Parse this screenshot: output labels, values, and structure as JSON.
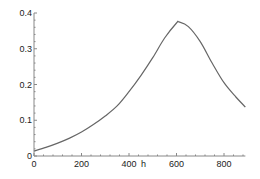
{
  "chart_data": {
    "type": "line",
    "title": "",
    "xlabel": "h",
    "ylabel": "",
    "xlim": [
      0,
      890
    ],
    "ylim": [
      0,
      0.4
    ],
    "grid": false,
    "legend": null,
    "x_ticks": [
      "0",
      "200",
      "400",
      "600",
      "800"
    ],
    "y_ticks": [
      "0",
      "0.1",
      "0.2",
      "0.3",
      "0.4"
    ],
    "series": [
      {
        "name": "curve",
        "color": "#666666",
        "x": [
          0,
          50,
          100,
          150,
          200,
          250,
          300,
          350,
          400,
          450,
          500,
          550,
          600,
          610,
          650,
          700,
          750,
          800,
          850,
          890
        ],
        "values": [
          0.014,
          0.024,
          0.036,
          0.05,
          0.067,
          0.088,
          0.112,
          0.14,
          0.18,
          0.225,
          0.275,
          0.33,
          0.372,
          0.375,
          0.362,
          0.32,
          0.26,
          0.205,
          0.165,
          0.137
        ]
      }
    ]
  }
}
